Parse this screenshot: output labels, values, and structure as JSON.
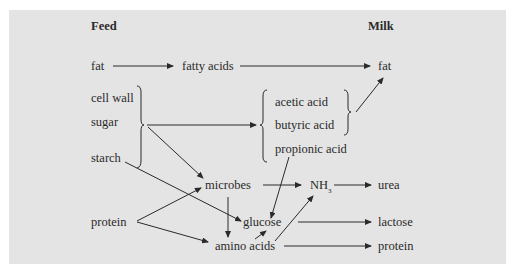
{
  "headers": {
    "feed": "Feed",
    "milk": "Milk"
  },
  "feed": {
    "fat": "fat",
    "cell_wall": "cell wall",
    "sugar": "sugar",
    "starch": "starch",
    "protein": "protein"
  },
  "intermediates": {
    "fatty_acids": "fatty acids",
    "acetic_acid": "acetic acid",
    "butyric_acid": "butyric acid",
    "propionic_acid": "propionic acid",
    "microbes": "microbes",
    "nh3": "NH",
    "nh3_sub": "3",
    "glucose": "glucose",
    "amino_acids": "amino acids"
  },
  "milk": {
    "fat": "fat",
    "urea": "urea",
    "lactose": "lactose",
    "protein": "protein"
  },
  "colors": {
    "panel": "#e4e4e4",
    "ink": "#2a2a2a"
  },
  "edges": [
    [
      "fat",
      "fatty acids"
    ],
    [
      "fatty acids",
      "milk fat"
    ],
    [
      "cell wall/sugar/starch",
      "acetic/butyric/propionic acid"
    ],
    [
      "cell wall/sugar/starch",
      "microbes"
    ],
    [
      "starch",
      "glucose"
    ],
    [
      "acetic/butyric acid",
      "milk fat"
    ],
    [
      "propionic acid",
      "glucose"
    ],
    [
      "protein",
      "microbes"
    ],
    [
      "protein",
      "amino acids"
    ],
    [
      "microbes",
      "amino acids"
    ],
    [
      "microbes",
      "NH3"
    ],
    [
      "NH3",
      "urea"
    ],
    [
      "amino acids",
      "glucose"
    ],
    [
      "amino acids",
      "NH3"
    ],
    [
      "glucose",
      "lactose"
    ],
    [
      "amino acids",
      "milk protein"
    ]
  ]
}
